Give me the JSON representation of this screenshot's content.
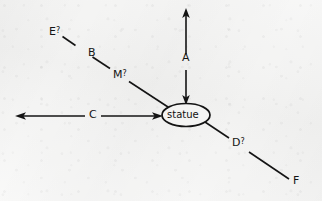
{
  "diagram": {
    "type": "hand-drawn-route-diagram",
    "background_color": "#f4f4f3",
    "ink_color": "#141414",
    "center_node": {
      "label": "statue",
      "shape": "ellipse",
      "cx": 186,
      "cy": 115,
      "rx": 24,
      "ry": 11
    },
    "labels": {
      "a": "A",
      "b": "B",
      "c": "C",
      "d": "D",
      "e": "E",
      "f": "F",
      "m": "M",
      "mark": "?"
    },
    "label_texts": {
      "a": "A",
      "b": "B",
      "c": "C",
      "d": "D?",
      "e": "E?",
      "f": "F",
      "m": "M?"
    },
    "edges": [
      {
        "name": "vertical-double-arrow",
        "label": "A",
        "arrowheads": "both",
        "from": [
          186,
          104
        ],
        "to": [
          186,
          10
        ],
        "orientation": "vertical"
      },
      {
        "name": "horizontal-double-arrow",
        "label": "C",
        "arrowheads": "both",
        "from": [
          162,
          116
        ],
        "to": [
          16,
          116
        ],
        "orientation": "horizontal"
      },
      {
        "name": "northwest-diagonal",
        "labels": [
          "M?",
          "B",
          "E?"
        ],
        "arrowheads": "none",
        "from": [
          166,
          106
        ],
        "to": [
          62,
          36
        ],
        "orientation": "diagonal-nw"
      },
      {
        "name": "southeast-diagonal",
        "labels": [
          "D?",
          "F"
        ],
        "arrowheads": "none",
        "from": [
          207,
          123
        ],
        "to": [
          291,
          180
        ],
        "orientation": "diagonal-se"
      }
    ]
  }
}
